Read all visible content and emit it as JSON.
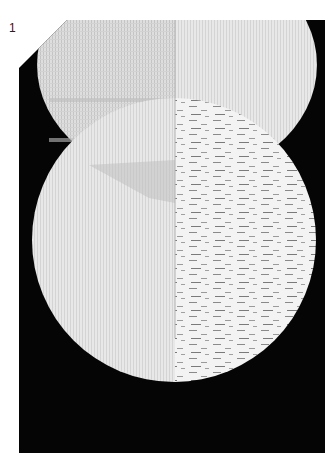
{
  "page": {
    "number": "1"
  },
  "photo": {
    "subject": "woven tapestry sample with two overlapping circles, left half plain weave, right half textured weave",
    "colors": {
      "background": "#050505",
      "weave_light": "#e6e6e6",
      "weave_mid": "#cfcfcf",
      "weave_texture": "#f2f2f2",
      "weave_dark_streak": "#8a8a8a"
    }
  }
}
